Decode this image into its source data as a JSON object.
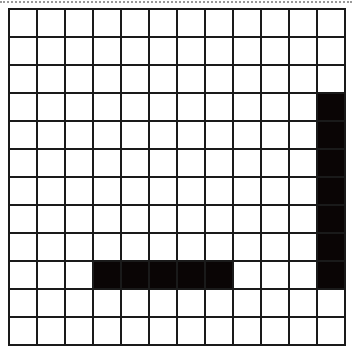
{
  "grid": {
    "rows": 12,
    "cols": 12,
    "cell_size_px": 28,
    "line_color": "#1a1a1a",
    "fill_color": "#0a0505",
    "background_color": "#ffffff",
    "filled_cells": [
      [
        3,
        11
      ],
      [
        4,
        11
      ],
      [
        5,
        11
      ],
      [
        6,
        11
      ],
      [
        7,
        11
      ],
      [
        8,
        11
      ],
      [
        9,
        11
      ],
      [
        9,
        3
      ],
      [
        9,
        4
      ],
      [
        9,
        5
      ],
      [
        9,
        6
      ],
      [
        9,
        7
      ]
    ],
    "shapes": [
      {
        "name": "vertical-bar",
        "col": 11,
        "row_start": 3,
        "row_end": 9
      },
      {
        "name": "horizontal-bar",
        "row": 9,
        "col_start": 3,
        "col_end": 7
      }
    ]
  }
}
